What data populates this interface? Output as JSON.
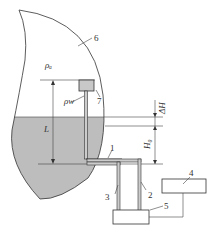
{
  "diagram": {
    "type": "liquid level measurement schematic",
    "components": [
      {
        "id": "1",
        "label": "1",
        "desc": "horizontal pipe section"
      },
      {
        "id": "2",
        "label": "2",
        "desc": "outer vertical pipe"
      },
      {
        "id": "3",
        "label": "3",
        "desc": "inner vertical pipe"
      },
      {
        "id": "4",
        "label": "4",
        "desc": "upper box"
      },
      {
        "id": "5",
        "label": "5",
        "desc": "lower box"
      },
      {
        "id": "6",
        "label": "6",
        "desc": "tank"
      },
      {
        "id": "7",
        "label": "7",
        "desc": "float/sensor"
      }
    ],
    "symbols": {
      "rho_a": "ρₐ",
      "rho_w": "ρw",
      "L": "L",
      "delta_H": "ΔH",
      "H0": "H₀"
    },
    "colors": {
      "liquid": "#bdbdbd",
      "lines": "#333333",
      "background": "#ffffff",
      "sensor": "#c8c8c8"
    }
  }
}
